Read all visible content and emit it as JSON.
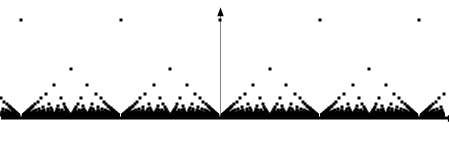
{
  "figure": {
    "width": 449,
    "height": 142,
    "background_color": "#ffffff",
    "ink_color": "#000000"
  },
  "chart_data": {
    "type": "scatter",
    "title": "",
    "subtitle": "",
    "xlabel": "",
    "ylabel": "",
    "function": "f(p/q) = 1/q",
    "grid": false,
    "legend": false,
    "legend_position": "none",
    "xlim": [
      -2.2,
      2.25
    ],
    "ylim": [
      0,
      1.08
    ],
    "max_denominator": 40,
    "marker": {
      "shape": "square",
      "size_px": 3,
      "color": "#000000"
    },
    "axes": {
      "x_axis": {
        "visible": true,
        "y_value": 0,
        "x_start": -2.2,
        "x_end": 2.25,
        "arrow": "right",
        "tick_labels": [],
        "color": "#000000",
        "line_width_px": 1.2
      },
      "y_axis": {
        "visible": true,
        "x_value": 0,
        "y_start": 0,
        "y_end": 1.08,
        "arrow": "up",
        "tick_labels": [],
        "color": "#808080",
        "line_width_px": 1
      }
    },
    "notable_levels": [
      {
        "denominator": 1,
        "value": 1.0,
        "pixel_y": 20,
        "label": "integers"
      },
      {
        "denominator": 2,
        "value": 0.5,
        "pixel_y": 69,
        "label": "halves"
      },
      {
        "denominator": 3,
        "value": 0.3333,
        "pixel_y": 85,
        "label": "thirds"
      },
      {
        "denominator": 4,
        "value": 0.25,
        "pixel_y": 94,
        "label": "quarters"
      },
      {
        "denominator": 5,
        "value": 0.2,
        "pixel_y": 98,
        "label": "fifths"
      }
    ],
    "pixel_geometry": {
      "origin_x": 220,
      "origin_y": 118,
      "unit_x_px": 99.5,
      "unit_y_px": 98
    },
    "series": [
      {
        "name": "f(x) = 1/q",
        "points_visible_top_level": [
          {
            "x": -2,
            "y": 1.0
          },
          {
            "x": -1,
            "y": 1.0
          },
          {
            "x": 0,
            "y": 1.0
          },
          {
            "x": 1,
            "y": 1.0
          },
          {
            "x": 2,
            "y": 1.0
          }
        ],
        "points_visible_half_level": [
          {
            "x": -1.5,
            "y": 0.5
          },
          {
            "x": -0.5,
            "y": 0.5
          },
          {
            "x": 0.5,
            "y": 0.5
          },
          {
            "x": 1.5,
            "y": 0.5
          }
        ],
        "points_visible_third_level": [
          {
            "x": -1.6667,
            "y": 0.3333
          },
          {
            "x": -1.3333,
            "y": 0.3333
          },
          {
            "x": -0.6667,
            "y": 0.3333
          },
          {
            "x": -0.3333,
            "y": 0.3333
          },
          {
            "x": 0.3333,
            "y": 0.3333
          },
          {
            "x": 0.6667,
            "y": 0.3333
          },
          {
            "x": 1.3333,
            "y": 0.3333
          },
          {
            "x": 1.6667,
            "y": 0.3333
          }
        ],
        "points_visible_quarter_level": [
          {
            "x": -1.75,
            "y": 0.25
          },
          {
            "x": -1.25,
            "y": 0.25
          },
          {
            "x": -0.75,
            "y": 0.25
          },
          {
            "x": -0.25,
            "y": 0.25
          },
          {
            "x": 0.25,
            "y": 0.25
          },
          {
            "x": 0.75,
            "y": 0.25
          },
          {
            "x": 1.25,
            "y": 0.25
          },
          {
            "x": 1.75,
            "y": 0.25
          }
        ]
      }
    ]
  }
}
